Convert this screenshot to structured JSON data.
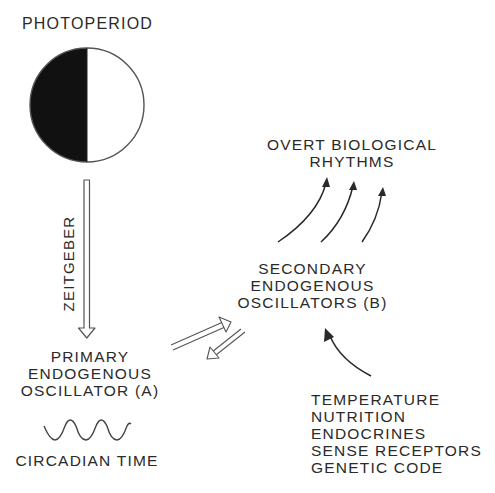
{
  "diagram": {
    "photoperiod": {
      "label": "PHOTOPERIOD",
      "icon": "half-dark-circle-icon",
      "dark_color": "#111111",
      "light_color": "#ffffff"
    },
    "zeitgeber": {
      "label": "ZEITGEBER",
      "arrow": "hollow-down-arrow"
    },
    "primary_oscillator": {
      "lines": [
        "PRIMARY",
        "ENDOGENOUS",
        "OSCILLATOR (A)"
      ]
    },
    "circadian_time": {
      "label": "CIRCADIAN TIME",
      "icon": "sine-wave-icon"
    },
    "secondary_oscillators": {
      "lines": [
        "SECONDARY",
        "ENDOGENOUS",
        "OSCILLATORS (B)"
      ]
    },
    "overt_rhythms": {
      "lines": [
        "OVERT BIOLOGICAL",
        "RHYTHMS"
      ],
      "arrow_count": 3
    },
    "influences": {
      "items": [
        "TEMPERATURE",
        "NUTRITION",
        "ENDOCRINES",
        "SENSE RECEPTORS",
        "GENETIC CODE"
      ]
    },
    "colors": {
      "ink": "#2a2a2a",
      "background": "#ffffff"
    }
  }
}
